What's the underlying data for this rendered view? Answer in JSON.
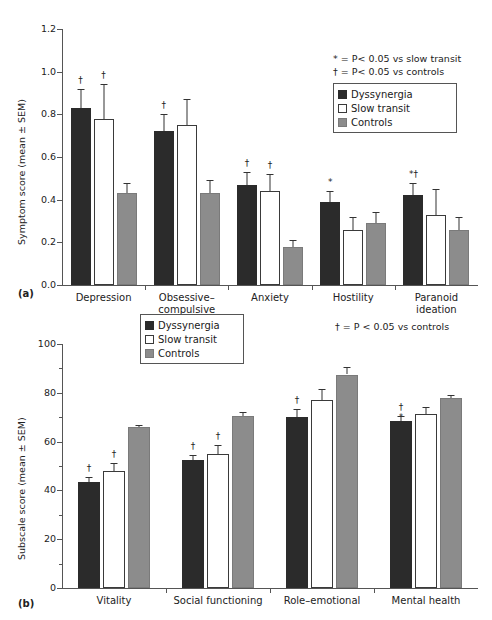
{
  "figure": {
    "panel_a_tag": "(a)",
    "panel_b_tag": "(b)"
  },
  "legend": {
    "items": [
      {
        "label": "Dyssynergia",
        "color": "#2b2b2b"
      },
      {
        "label": "Slow transit",
        "color": "#ffffff"
      },
      {
        "label": "Controls",
        "color": "#8c8c8c"
      }
    ]
  },
  "notes": {
    "panel_a_line1": "* = P< 0.05 vs slow transit",
    "panel_a_line2": "† = P< 0.05 vs controls",
    "panel_b_line1": "† = P < 0.05 vs controls"
  },
  "panel_a": {
    "y_axis_label": "Symptom score (mean ± SEM)",
    "y_ticks": [
      "0.0",
      "0.2",
      "0.4",
      "0.6",
      "0.8",
      "1.0",
      "1.2"
    ],
    "categories": [
      "Depression",
      "Obsessive–\ncompulsive",
      "Anxiety",
      "Hostility",
      "Paranoid\nideation"
    ]
  },
  "panel_b": {
    "y_axis_label": "Subscale score (mean ± SEM)",
    "y_ticks": [
      "0",
      "20",
      "40",
      "60",
      "80",
      "100"
    ],
    "categories": [
      "Vitality",
      "Social functioning",
      "Role–emotional",
      "Mental health"
    ]
  },
  "chart_data": [
    {
      "type": "bar",
      "panel": "(a)",
      "title": "",
      "xlabel": "",
      "ylabel": "Symptom score (mean ± SEM)",
      "ylim": [
        0,
        1.2
      ],
      "ytick_step": 0.2,
      "grid": false,
      "legend_position": "top-right",
      "categories": [
        "Depression",
        "Obsessive–compulsive",
        "Anxiety",
        "Hostility",
        "Paranoid ideation"
      ],
      "series": [
        {
          "name": "Dyssynergia",
          "color": "#2b2b2b",
          "values": [
            0.83,
            0.72,
            0.47,
            0.39,
            0.42
          ],
          "errors": [
            0.09,
            0.08,
            0.06,
            0.05,
            0.06
          ],
          "annotations": [
            "†",
            "†",
            "†",
            "*",
            "*†"
          ]
        },
        {
          "name": "Slow transit",
          "color": "#ffffff",
          "values": [
            0.78,
            0.75,
            0.44,
            0.26,
            0.33
          ],
          "errors": [
            0.16,
            0.12,
            0.08,
            0.06,
            0.12
          ],
          "annotations": [
            "†",
            "",
            "†",
            "",
            ""
          ]
        },
        {
          "name": "Controls",
          "color": "#8c8c8c",
          "values": [
            0.43,
            0.43,
            0.18,
            0.29,
            0.26
          ],
          "errors": [
            0.05,
            0.06,
            0.03,
            0.05,
            0.06
          ],
          "annotations": [
            "",
            "",
            "",
            "",
            ""
          ]
        }
      ]
    },
    {
      "type": "bar",
      "panel": "(b)",
      "title": "",
      "xlabel": "",
      "ylabel": "Subscale score (mean ± SEM)",
      "ylim": [
        0,
        100
      ],
      "ytick_step": 20,
      "minor_tick_step": 10,
      "grid": false,
      "legend_position": "top-center",
      "categories": [
        "Vitality",
        "Social functioning",
        "Role–emotional",
        "Mental health"
      ],
      "series": [
        {
          "name": "Dyssynergia",
          "color": "#2b2b2b",
          "values": [
            43.5,
            52.5,
            70.0,
            68.5
          ],
          "errors": [
            1.8,
            2.0,
            3.5,
            2.0
          ],
          "annotations": [
            "†",
            "†",
            "†",
            "†"
          ],
          "inner_annotations": [
            "",
            "",
            "",
            "*"
          ]
        },
        {
          "name": "Slow transit",
          "color": "#ffffff",
          "values": [
            48.0,
            55.0,
            77.0,
            71.5
          ],
          "errors": [
            3.2,
            3.5,
            4.5,
            2.5
          ],
          "annotations": [
            "†",
            "†",
            "",
            ""
          ],
          "inner_annotations": [
            "",
            "",
            "",
            ""
          ]
        },
        {
          "name": "Controls",
          "color": "#8c8c8c",
          "values": [
            66.0,
            70.5,
            87.5,
            78.0
          ],
          "errors": [
            1.0,
            1.5,
            3.0,
            1.2
          ],
          "annotations": [
            "",
            "",
            "",
            ""
          ],
          "inner_annotations": [
            "",
            "",
            "",
            ""
          ]
        }
      ]
    }
  ]
}
